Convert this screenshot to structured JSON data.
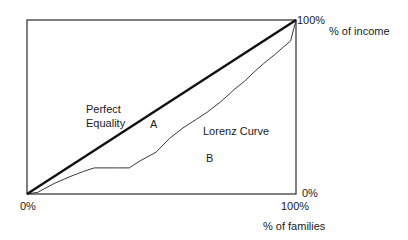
{
  "chart_data": {
    "type": "line",
    "title": "",
    "xlabel": "% of families",
    "ylabel": "% of income",
    "xlim": [
      0,
      100
    ],
    "ylim": [
      0,
      100
    ],
    "grid": false,
    "x_tick_labels": {
      "min": "0%",
      "max": "100%"
    },
    "y_tick_labels": {
      "min": "0%",
      "max": "100%"
    },
    "series": [
      {
        "name": "Perfect Equality",
        "style": "thick",
        "x": [
          0,
          100
        ],
        "y": [
          0,
          100
        ]
      },
      {
        "name": "Lorenz Curve",
        "style": "thin",
        "x": [
          0,
          4,
          10,
          16,
          21,
          25,
          34,
          38,
          42,
          48,
          53,
          58,
          63,
          67,
          72,
          77,
          81,
          85,
          88,
          92,
          95,
          98,
          100
        ],
        "y": [
          0,
          1,
          6,
          10,
          13,
          15,
          15,
          15,
          19,
          24,
          32,
          38,
          43,
          47,
          53,
          60,
          65,
          71,
          75,
          80,
          84,
          88,
          100
        ]
      }
    ],
    "annotations": [
      {
        "text": "Perfect",
        "target": "equality-line-label-line1"
      },
      {
        "text": "Equality",
        "target": "equality-line-label-line2"
      },
      {
        "text": "A",
        "region": "between equality line and Lorenz curve"
      },
      {
        "text": "B",
        "region": "below Lorenz curve"
      },
      {
        "text": "Lorenz Curve",
        "target": "lorenz-curve"
      }
    ]
  },
  "labels": {
    "perfect": "Perfect",
    "equality": "Equality",
    "area_a": "A",
    "area_b": "B",
    "lorenz": "Lorenz Curve",
    "origin": "0%",
    "x_max": "100%",
    "y_max": "100%",
    "y_min_right": "0%",
    "y_axis_title": "% of income",
    "x_axis_title": "% of families"
  }
}
